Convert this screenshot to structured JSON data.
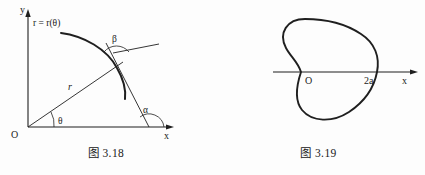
{
  "page": {
    "background_color": "#fdfdfd",
    "ink_color": "#1f1f1f"
  },
  "figures": [
    {
      "id": "fig-3-18",
      "caption": "图 3.18",
      "description": "Polar curve r = r(theta) with radius vector, tangent line, angles theta, alpha, beta",
      "axes": {
        "x_label": "x",
        "y_label": "y",
        "origin_label": "O"
      },
      "labels": {
        "curve_label": "r = r(θ)",
        "radius_label": "r",
        "angle_theta": "θ",
        "angle_alpha": "α",
        "angle_beta": "β"
      }
    },
    {
      "id": "fig-3-19",
      "caption": "图 3.19",
      "description": "Cardioid curve with cusp at origin O and rightmost point labelled 2a",
      "axes": {
        "x_label": "x",
        "origin_label": "O"
      },
      "labels": {
        "rightmost_label": "2a"
      }
    }
  ]
}
